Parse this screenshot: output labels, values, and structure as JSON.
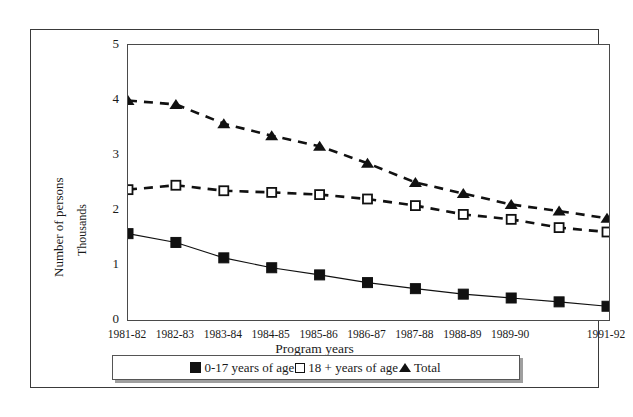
{
  "chart_data": {
    "type": "line",
    "title": "",
    "xlabel": "Program years",
    "ylabel": "Number of persons",
    "ylabel_secondary": "Thousands",
    "ylim": [
      0,
      5
    ],
    "ytick_labels": [
      "0",
      "1",
      "2",
      "3",
      "4",
      "5"
    ],
    "ytick_values": [
      0,
      1,
      2,
      3,
      4,
      5
    ],
    "grid": false,
    "legend_position": "bottom",
    "categories": [
      "1981-82",
      "1982-83",
      "1983-84",
      "1984-85",
      "1985-86",
      "1986-87",
      "1987-88",
      "1988-89",
      "1989-90",
      "",
      "1991-92"
    ],
    "xtick_labels_visible": [
      "1981-82",
      "1982-83",
      "1983-84",
      "1984-85",
      "1985-86",
      "1986-87",
      "1987-88",
      "1988-89",
      "1989-90",
      "1991-92"
    ],
    "series": [
      {
        "name": "0-17 years of age",
        "marker": "filled-square",
        "line_style": "solid",
        "color": "#111111",
        "values": [
          1.57,
          1.41,
          1.13,
          0.95,
          0.82,
          0.68,
          0.57,
          0.47,
          0.4,
          0.33,
          0.25
        ]
      },
      {
        "name": "18 + years of age",
        "marker": "open-square",
        "line_style": "dashed",
        "color": "#111111",
        "values": [
          2.37,
          2.45,
          2.35,
          2.32,
          2.28,
          2.2,
          2.08,
          1.92,
          1.83,
          1.68,
          1.6
        ]
      },
      {
        "name": "Total",
        "marker": "triangle",
        "line_style": "dashed",
        "color": "#111111",
        "values": [
          3.99,
          3.92,
          3.57,
          3.35,
          3.16,
          2.85,
          2.5,
          2.3,
          2.1,
          1.98,
          1.85
        ]
      }
    ]
  },
  "axes": {
    "y_title_outer": "Number of persons",
    "y_title_inner": "Thousands",
    "x_title": "Program years"
  },
  "legend": {
    "entries": [
      {
        "label": "0-17 years of age",
        "marker": "filled-square-marker"
      },
      {
        "label": "18 + years of age",
        "marker": "open-square-marker"
      },
      {
        "label": "Total",
        "marker": "triangle-marker"
      }
    ]
  }
}
